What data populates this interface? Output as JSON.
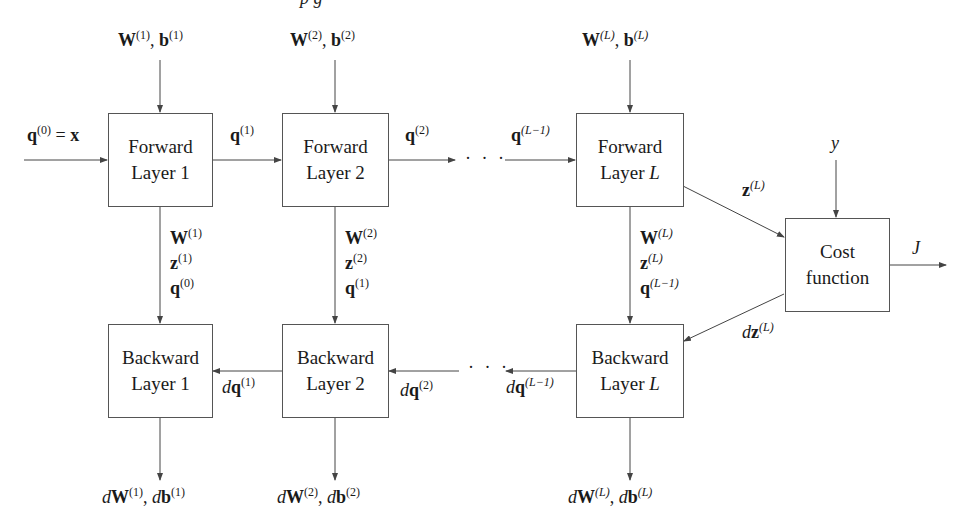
{
  "caption_fragment": "p                          g",
  "boxes": {
    "forward_1": {
      "line1": "Forward",
      "line2": "Layer 1"
    },
    "forward_2": {
      "line1": "Forward",
      "line2": "Layer 2"
    },
    "forward_L": {
      "line1": "Forward",
      "line2": "Layer ",
      "line2_var": "L"
    },
    "backward_1": {
      "line1": "Backward",
      "line2": "Layer 1"
    },
    "backward_2": {
      "line1": "Backward",
      "line2": "Layer 2"
    },
    "backward_L": {
      "line1": "Backward",
      "line2": "Layer ",
      "line2_var": "L"
    },
    "cost": {
      "line1": "Cost",
      "line2": "function"
    }
  },
  "params_in": [
    {
      "W": "W",
      "W_sup": "(1)",
      "b": "b",
      "b_sup": "(1)"
    },
    {
      "W": "W",
      "W_sup": "(2)",
      "b": "b",
      "b_sup": "(2)"
    },
    {
      "W": "W",
      "W_sup": "(L)",
      "b": "b",
      "b_sup": "(L)"
    }
  ],
  "forward_signals": {
    "input": {
      "q": "q",
      "sup": "(0)",
      "eq": " = ",
      "x": "x"
    },
    "q1": {
      "q": "q",
      "sup": "(1)"
    },
    "q2": {
      "q": "q",
      "sup": "(2)"
    },
    "qLm1": {
      "q": "q",
      "sup": "(L−1)"
    },
    "zL": {
      "z": "z",
      "sup": "(L)"
    },
    "y": "y",
    "J": "J",
    "dots": "· · ·"
  },
  "cache": [
    {
      "W": "W",
      "W_sup": "(1)",
      "z": "z",
      "z_sup": "(1)",
      "q": "q",
      "q_sup": "(0)"
    },
    {
      "W": "W",
      "W_sup": "(2)",
      "z": "z",
      "z_sup": "(2)",
      "q": "q",
      "q_sup": "(1)"
    },
    {
      "W": "W",
      "W_sup": "(L)",
      "z": "z",
      "z_sup": "(L)",
      "q": "q",
      "q_sup": "(L−1)"
    }
  ],
  "backward_signals": {
    "dzL": {
      "d": "d",
      "z": "z",
      "sup": "(L)"
    },
    "dq1": {
      "d": "d",
      "q": "q",
      "sup": "(1)"
    },
    "dq2": {
      "d": "d",
      "q": "q",
      "sup": "(2)"
    },
    "dqLm1": {
      "d": "d",
      "q": "q",
      "sup": "(L−1)"
    },
    "dots": "· · ·"
  },
  "grads_out": [
    {
      "d": "d",
      "W": "W",
      "W_sup": "(1)",
      "sep": ", ",
      "b": "b",
      "b_sup": "(1)"
    },
    {
      "d": "d",
      "W": "W",
      "W_sup": "(2)",
      "sep": ", ",
      "b": "b",
      "b_sup": "(2)"
    },
    {
      "d": "d",
      "W": "W",
      "W_sup": "(L)",
      "sep": ", ",
      "b": "b",
      "b_sup": "(L)"
    }
  ],
  "colors": {
    "line": "#444444",
    "box_border": "#555555",
    "text": "#1a1a1a"
  }
}
